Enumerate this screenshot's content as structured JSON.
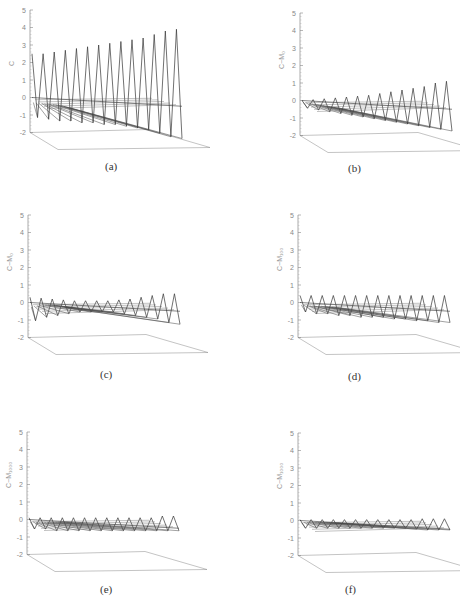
{
  "figure": {
    "panels": [
      {
        "id": "a",
        "caption": "(a)",
        "ylabel": "C"
      },
      {
        "id": "b",
        "caption": "(b)",
        "ylabel": "C−M₀"
      },
      {
        "id": "c",
        "caption": "(c)",
        "ylabel": "C−M₀"
      },
      {
        "id": "d",
        "caption": "(d)",
        "ylabel": "C−M₁₀₀"
      },
      {
        "id": "e",
        "caption": "(e)",
        "ylabel": "C−M₁₀₀₀"
      },
      {
        "id": "f",
        "caption": "(f)",
        "ylabel": "C−M₁₀₀₀"
      }
    ],
    "y_ticks": [
      "5",
      "4",
      "3",
      "2",
      "1",
      "0",
      "-1",
      "-2"
    ]
  },
  "chart_data": [
    {
      "type": "surface-3d",
      "title": "(a)",
      "zlabel": "C",
      "zlim": [
        -2,
        5
      ],
      "zticks": [
        -2,
        -1,
        0,
        1,
        2,
        3,
        4,
        5
      ],
      "description": "zig-zag surface; peaks rising from ~2.5 to ~4 along depth axis, troughs ~-1 to -2",
      "peaks": [
        2.5,
        2.5,
        2.6,
        2.7,
        2.8,
        2.9,
        3.0,
        3.1,
        3.2,
        3.3,
        3.4,
        3.6,
        3.8,
        3.9
      ],
      "troughs": [
        -0.8,
        -0.9,
        -1.0,
        -1.0,
        -1.1,
        -1.1,
        -1.2,
        -1.2,
        -1.3,
        -1.4,
        -1.5,
        -1.7,
        -1.9,
        -2.0
      ]
    },
    {
      "type": "surface-3d",
      "title": "(b)",
      "zlabel": "C−M₀",
      "zlim": [
        -2,
        5
      ],
      "zticks": [
        -2,
        -1,
        0,
        1,
        2,
        3,
        4,
        5
      ],
      "description": "oscillations growing from ~0 to ~1 amplitude",
      "peaks": [
        0.0,
        0.05,
        0.1,
        0.15,
        0.2,
        0.25,
        0.3,
        0.4,
        0.5,
        0.6,
        0.7,
        0.8,
        1.0,
        1.1
      ],
      "troughs": [
        -0.1,
        -0.2,
        -0.3,
        -0.4,
        -0.5,
        -0.6,
        -0.7,
        -0.8,
        -0.9,
        -1.0,
        -1.1,
        -1.2,
        -1.3,
        -1.4
      ]
    },
    {
      "type": "surface-3d",
      "title": "(c)",
      "zlabel": "C−M₀",
      "zlim": [
        -2,
        5
      ],
      "zticks": [
        -2,
        -1,
        0,
        1,
        2,
        3,
        4,
        5
      ],
      "description": "small oscillations about 0, amplitude ~0.3-0.5",
      "peaks": [
        0.3,
        0.25,
        0.2,
        0.15,
        0.1,
        0.1,
        0.1,
        0.1,
        0.15,
        0.2,
        0.3,
        0.4,
        0.5,
        0.5
      ],
      "troughs": [
        -0.7,
        -0.5,
        -0.4,
        -0.3,
        -0.2,
        -0.2,
        -0.2,
        -0.2,
        -0.3,
        -0.4,
        -0.5,
        -0.6,
        -0.8,
        -0.9
      ]
    },
    {
      "type": "surface-3d",
      "title": "(d)",
      "zlabel": "C−M₁₀₀",
      "zlim": [
        -2,
        5
      ],
      "zticks": [
        -2,
        -1,
        0,
        1,
        2,
        3,
        4,
        5
      ],
      "description": "regular oscillation peaks ~0.4",
      "peaks": [
        0.4,
        0.4,
        0.4,
        0.4,
        0.4,
        0.4,
        0.4,
        0.4,
        0.4,
        0.4,
        0.4,
        0.4,
        0.4,
        0.4
      ],
      "troughs": [
        -0.2,
        -0.3,
        -0.3,
        -0.4,
        -0.4,
        -0.5,
        -0.5,
        -0.5,
        -0.6,
        -0.6,
        -0.7,
        -0.7,
        -0.8,
        -0.8
      ]
    },
    {
      "type": "surface-3d",
      "title": "(e)",
      "zlabel": "C−M₁₀₀₀",
      "zlim": [
        -2,
        5
      ],
      "zticks": [
        -2,
        -1,
        0,
        1,
        2,
        3,
        4,
        5
      ],
      "description": "near-flat surface with small ripples ~0.2",
      "peaks": [
        0.1,
        0.1,
        0.1,
        0.1,
        0.1,
        0.1,
        0.1,
        0.1,
        0.1,
        0.1,
        0.1,
        0.1,
        0.2,
        0.2
      ],
      "troughs": [
        -0.2,
        -0.2,
        -0.3,
        -0.3,
        -0.3,
        -0.3,
        -0.3,
        -0.3,
        -0.3,
        -0.3,
        -0.3,
        -0.3,
        -0.3,
        -0.3
      ]
    },
    {
      "type": "surface-3d",
      "title": "(f)",
      "zlabel": "C−M₁₀₀₀",
      "zlim": [
        -2,
        5
      ],
      "zticks": [
        -2,
        -1,
        0,
        1,
        2,
        3,
        4,
        5
      ],
      "description": "essentially flat surface with tiny ripples",
      "peaks": [
        0.05,
        0.05,
        0.05,
        0.05,
        0.05,
        0.05,
        0.05,
        0.05,
        0.05,
        0.05,
        0.05,
        0.1,
        0.1,
        0.1
      ],
      "troughs": [
        -0.1,
        -0.1,
        -0.1,
        -0.1,
        -0.1,
        -0.1,
        -0.1,
        -0.1,
        -0.1,
        -0.1,
        -0.15,
        -0.2,
        -0.2,
        -0.2
      ]
    }
  ]
}
